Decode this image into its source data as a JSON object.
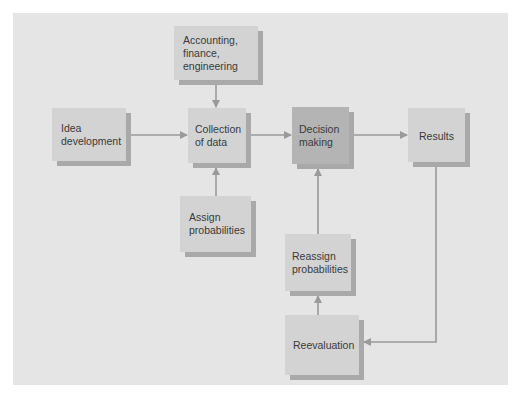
{
  "diagram": {
    "title": "",
    "nodes": [
      {
        "id": "accounting",
        "label": "Accounting,\nfinance,\nengineering"
      },
      {
        "id": "idea",
        "label": "Idea\ndevelopment"
      },
      {
        "id": "collection",
        "label": "Collection\nof data"
      },
      {
        "id": "decision",
        "label": "Decision\nmaking"
      },
      {
        "id": "results",
        "label": "Results"
      },
      {
        "id": "assign",
        "label": "Assign\nprobabilities"
      },
      {
        "id": "reassign",
        "label": "Reassign\nprobabilities"
      },
      {
        "id": "reevaluation",
        "label": "Reevaluation"
      }
    ],
    "edges": [
      {
        "from": "accounting",
        "to": "collection"
      },
      {
        "from": "idea",
        "to": "collection"
      },
      {
        "from": "assign",
        "to": "collection"
      },
      {
        "from": "collection",
        "to": "decision"
      },
      {
        "from": "decision",
        "to": "results"
      },
      {
        "from": "results",
        "to": "reevaluation"
      },
      {
        "from": "reevaluation",
        "to": "reassign"
      },
      {
        "from": "reassign",
        "to": "decision"
      }
    ],
    "colors": {
      "background": "#e5e5e5",
      "box": "#d3d3d3",
      "box_highlight": "#b4b4b4",
      "shadow": "#a9a9a9",
      "connector": "#9a9a9a",
      "text": "#3a3a3a"
    }
  }
}
